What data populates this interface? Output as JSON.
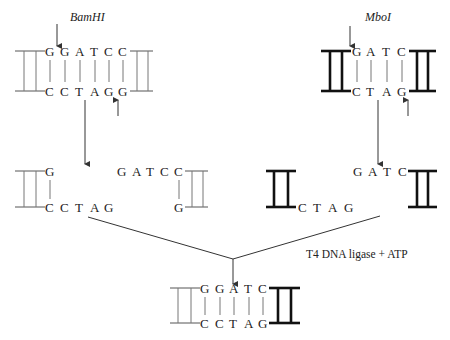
{
  "enzymes": {
    "left": "BamHI",
    "right": "MboI"
  },
  "top_left": {
    "top_strand": [
      "G",
      "G",
      "A",
      "T",
      "C",
      "C"
    ],
    "bottom_strand": [
      "C",
      "C",
      "T",
      "A",
      "G",
      "G"
    ]
  },
  "top_right": {
    "top_strand": [
      "G",
      "A",
      "T",
      "C"
    ],
    "bottom_strand": [
      "C",
      "T",
      "A",
      "G"
    ]
  },
  "middle_left_a": {
    "top": "G",
    "bottom": [
      "C",
      "C",
      "T",
      "A",
      "G"
    ]
  },
  "middle_left_b": {
    "top": [
      "G",
      "A",
      "T",
      "C",
      "C"
    ],
    "bottom": "G"
  },
  "middle_right_a": {
    "bottom": [
      "C",
      "T",
      "A",
      "G"
    ]
  },
  "middle_right_b": {
    "top": [
      "G",
      "A",
      "T",
      "C"
    ]
  },
  "ligation": {
    "label": "T4 DNA ligase + ATP"
  },
  "result": {
    "top_strand": [
      "G",
      "G",
      "A",
      "T",
      "C"
    ],
    "bottom_strand": [
      "C",
      "C",
      "T",
      "A",
      "G"
    ]
  }
}
